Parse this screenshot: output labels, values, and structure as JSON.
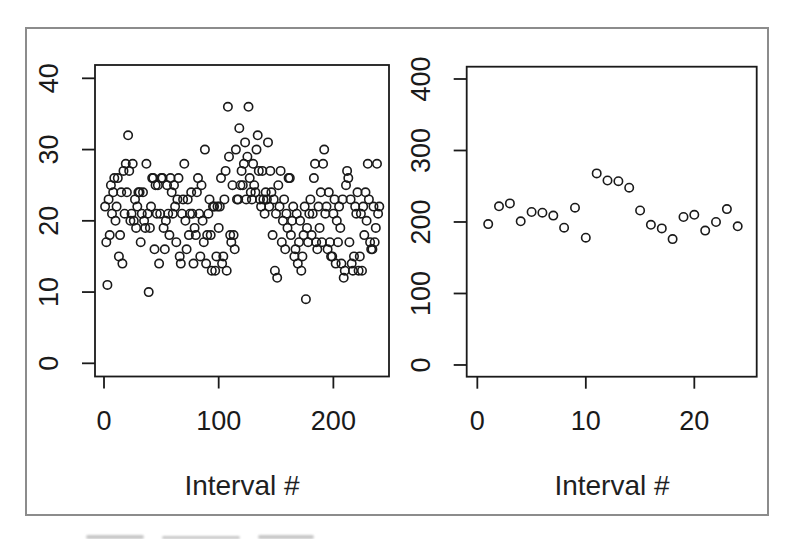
{
  "figure": {
    "background": "#ffffff",
    "frame_border_color": "#8c8c8c",
    "axis_color": "#1a1a1a",
    "point_color": "#1a1a1a"
  },
  "chart_data": [
    {
      "type": "scatter",
      "title": "",
      "xlabel": "Interval #",
      "ylabel": "",
      "legend": "none",
      "grid": false,
      "marker": {
        "shape": "open-circle",
        "radius": 4.2,
        "stroke_width": 1.6,
        "color": "#1a1a1a"
      },
      "x_ticks": [
        0,
        100,
        200
      ],
      "y_ticks": [
        0,
        10,
        20,
        30,
        40
      ],
      "xlim": [
        -7.85,
        248.5
      ],
      "ylim": [
        -1.85,
        41.87
      ],
      "x_start": 1,
      "y": [
        22,
        17,
        11,
        23,
        18,
        25,
        21,
        24,
        26,
        20,
        22,
        26,
        15,
        18,
        24,
        14,
        27,
        21,
        28,
        24,
        32,
        27,
        20,
        21,
        28,
        20,
        23,
        19,
        22,
        24,
        24,
        17,
        21,
        24,
        20,
        19,
        28,
        21,
        10,
        19,
        22,
        26,
        26,
        16,
        25,
        21,
        25,
        14,
        21,
        26,
        26,
        19,
        16,
        20,
        25,
        21,
        18,
        26,
        24,
        21,
        25,
        22,
        17,
        23,
        26,
        15,
        14,
        21,
        23,
        28,
        20,
        16,
        23,
        18,
        21,
        24,
        21,
        14,
        19,
        18,
        24,
        26,
        21,
        15,
        25,
        20,
        17,
        30,
        14,
        18,
        21,
        23,
        18,
        13,
        22,
        22,
        13,
        15,
        22,
        19,
        22,
        26,
        14,
        15,
        23,
        27,
        13,
        36,
        29,
        18,
        17,
        25,
        18,
        16,
        30,
        23,
        23,
        33,
        25,
        27,
        25,
        28,
        31,
        23,
        29,
        36,
        26,
        24,
        23,
        28,
        25,
        24,
        30,
        32,
        27,
        23,
        22,
        27,
        23,
        21,
        24,
        23,
        31,
        22,
        27,
        24,
        18,
        23,
        13,
        21,
        12,
        25,
        22,
        27,
        17,
        20,
        23,
        16,
        21,
        19,
        26,
        26,
        18,
        20,
        22,
        15,
        16,
        21,
        14,
        17,
        20,
        13,
        15,
        18,
        22,
        9,
        19,
        17,
        21,
        23,
        18,
        21,
        26,
        28,
        17,
        16,
        22,
        19,
        24,
        17,
        28,
        30,
        21,
        22,
        16,
        24,
        17,
        15,
        15,
        21,
        23,
        14,
        20,
        17,
        22,
        19,
        14,
        23,
        12,
        13,
        25,
        27,
        26,
        17,
        23,
        14,
        13,
        15,
        22,
        21,
        24,
        13,
        15,
        21,
        13,
        22,
        18,
        24,
        20,
        28,
        23,
        17,
        16,
        16,
        22,
        17,
        19,
        28,
        21,
        22
      ]
    },
    {
      "type": "scatter",
      "title": "",
      "xlabel": "Interval #",
      "ylabel": "",
      "legend": "none",
      "grid": false,
      "marker": {
        "shape": "open-circle",
        "radius": 4.2,
        "stroke_width": 1.6,
        "color": "#1a1a1a"
      },
      "x_ticks": [
        0,
        10,
        20
      ],
      "y_ticks": [
        0,
        100,
        200,
        300,
        400
      ],
      "xlim": [
        -0.98,
        25.75
      ],
      "ylim": [
        -16.4,
        417.2
      ],
      "x": [
        1,
        2,
        3,
        4,
        5,
        6,
        7,
        8,
        9,
        10,
        11,
        12,
        13,
        14,
        15,
        16,
        17,
        18,
        19,
        20,
        21,
        22,
        23,
        24
      ],
      "y": [
        197,
        222,
        226,
        201,
        214,
        213,
        209,
        192,
        220,
        178,
        268,
        258,
        257,
        248,
        216,
        196,
        191,
        176,
        207,
        210,
        188,
        200,
        218,
        194
      ]
    }
  ]
}
